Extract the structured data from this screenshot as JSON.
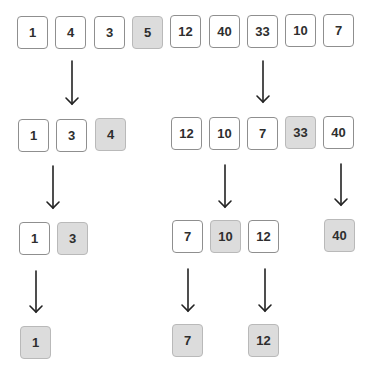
{
  "diagram": {
    "title": "",
    "levels": [
      {
        "level": 0,
        "groups": [
          {
            "cells": [
              {
                "value": "1",
                "pivot": false
              },
              {
                "value": "4",
                "pivot": false
              },
              {
                "value": "3",
                "pivot": false
              },
              {
                "value": "5",
                "pivot": true
              },
              {
                "value": "12",
                "pivot": false
              },
              {
                "value": "40",
                "pivot": false
              },
              {
                "value": "33",
                "pivot": false
              },
              {
                "value": "10",
                "pivot": false
              },
              {
                "value": "7",
                "pivot": false
              }
            ]
          }
        ]
      },
      {
        "level": 1,
        "groups": [
          {
            "cells": [
              {
                "value": "1",
                "pivot": false
              },
              {
                "value": "3",
                "pivot": false
              },
              {
                "value": "4",
                "pivot": true
              }
            ]
          },
          {
            "cells": [
              {
                "value": "12",
                "pivot": false
              },
              {
                "value": "10",
                "pivot": false
              },
              {
                "value": "7",
                "pivot": false
              },
              {
                "value": "33",
                "pivot": true
              },
              {
                "value": "40",
                "pivot": false
              }
            ]
          }
        ]
      },
      {
        "level": 2,
        "groups": [
          {
            "cells": [
              {
                "value": "1",
                "pivot": false
              },
              {
                "value": "3",
                "pivot": true
              }
            ]
          },
          {
            "cells": [
              {
                "value": "7",
                "pivot": false
              },
              {
                "value": "10",
                "pivot": true
              },
              {
                "value": "12",
                "pivot": false
              }
            ]
          },
          {
            "cells": [
              {
                "value": "40",
                "pivot": true
              }
            ]
          }
        ]
      },
      {
        "level": 3,
        "groups": [
          {
            "cells": [
              {
                "value": "1",
                "pivot": true
              }
            ]
          },
          {
            "cells": [
              {
                "value": "7",
                "pivot": true
              }
            ]
          },
          {
            "cells": [
              {
                "value": "12",
                "pivot": true
              }
            ]
          }
        ]
      }
    ],
    "colors": {
      "cell_fill": "#ffffff",
      "pivot_fill": "#dcdcdc",
      "cell_border": "#8f8f8f",
      "arrow": "#222222",
      "text": "#2e2e2e"
    }
  }
}
